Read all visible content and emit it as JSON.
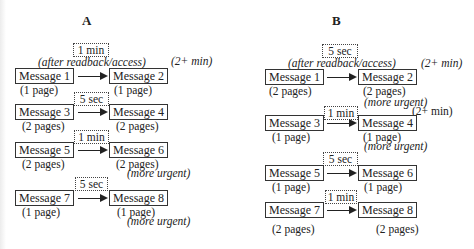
{
  "panels": {
    "a": {
      "label": "A",
      "rows": [
        {
          "timer": "1 min",
          "condition": "(after readback/access)",
          "followup": "(2+ min)",
          "left": {
            "name": "Message 1",
            "pages": "(1 page)"
          },
          "right": {
            "name": "Message 2",
            "pages": "(1 page)"
          }
        },
        {
          "timer": "5 sec",
          "left": {
            "name": "Message 3",
            "pages": "(2 pages)"
          },
          "right": {
            "name": "Message 4",
            "pages": "(2 pages)"
          }
        },
        {
          "timer": "1 min",
          "left": {
            "name": "Message 5",
            "pages": "(2 pages)"
          },
          "right": {
            "name": "Message 6",
            "pages": "(2 pages)",
            "priority": "(more urgent)"
          }
        },
        {
          "timer": "5 sec",
          "left": {
            "name": "Message 7",
            "pages": "(1 page)"
          },
          "right": {
            "name": "Message 8",
            "pages": "(1 page)",
            "priority": "(more urgent)"
          }
        }
      ]
    },
    "b": {
      "label": "B",
      "rows": [
        {
          "timer": "5 sec",
          "condition": "(after readback/access)",
          "followup": "(2+ min)",
          "left": {
            "name": "Message 1",
            "pages": "(2 pages)"
          },
          "right": {
            "name": "Message 2",
            "pages": "(2 pages)",
            "priority": "(more urgent)"
          }
        },
        {
          "timer": "1 min",
          "followup": "(2+ min)",
          "left": {
            "name": "Message 3",
            "pages": "(1 page)"
          },
          "right": {
            "name": "Message 4",
            "pages": "(1 page)",
            "priority": "(more urgent)"
          }
        },
        {
          "timer": "5 sec",
          "left": {
            "name": "Message 5",
            "pages": "(1 page)"
          },
          "right": {
            "name": "Message 6",
            "pages": "(1 page)"
          }
        },
        {
          "timer": "1 min",
          "left": {
            "name": "Message 7",
            "pages": "(2 pages)"
          },
          "right": {
            "name": "Message 8",
            "pages": "(2 pages)"
          }
        }
      ]
    }
  }
}
